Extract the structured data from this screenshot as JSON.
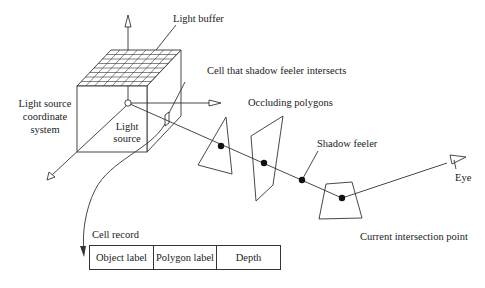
{
  "labels": {
    "light_buffer": "Light buffer",
    "cell_intersect": "Cell that shadow feeler intersects",
    "light_coord_line1": "Light source",
    "light_coord_line2": "coordinate",
    "light_coord_line3": "system",
    "light_source_line1": "Light",
    "light_source_line2": "source",
    "occluding": "Occluding polygons",
    "shadow_feeler": "Shadow feeler",
    "eye": "Eye",
    "current_point": "Current intersection point",
    "cell_record": "Cell record"
  },
  "cell_record": {
    "fields": [
      "Object label",
      "Polygon label",
      "Depth"
    ]
  },
  "colors": {
    "line": "#333333",
    "background": "#ffffff"
  }
}
